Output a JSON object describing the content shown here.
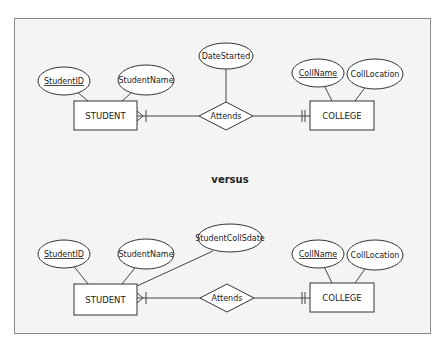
{
  "separator_label": "versus",
  "colors": {
    "frame_bg": "#f4f4f4",
    "frame_border": "#8a8a8a",
    "stroke": "#333333",
    "fill": "#ffffff"
  },
  "diagrams": [
    {
      "name": "diagram-1",
      "entities": [
        {
          "id": "student",
          "label": "STUDENT",
          "x": 74,
          "y": 101,
          "w": 63,
          "h": 29
        },
        {
          "id": "college",
          "label": "COLLEGE",
          "x": 310,
          "y": 101,
          "w": 64,
          "h": 29
        }
      ],
      "relationship": {
        "label": "Attends",
        "cx": 226,
        "cy": 116,
        "hw": 27,
        "hh": 14
      },
      "attributes": [
        {
          "label": "StudentID",
          "key": true,
          "cx": 64,
          "cy": 81,
          "rx": 26,
          "ry": 14,
          "to": [
            88,
            101
          ]
        },
        {
          "label": "StudentName",
          "key": false,
          "cx": 146,
          "cy": 80,
          "rx": 28,
          "ry": 15,
          "to": [
            122,
            101
          ]
        },
        {
          "label": "DateStarted",
          "key": false,
          "cx": 226,
          "cy": 56,
          "rx": 27,
          "ry": 13,
          "to": [
            226,
            102
          ]
        },
        {
          "label": "CollName",
          "key": true,
          "cx": 318,
          "cy": 73,
          "rx": 26,
          "ry": 14,
          "to": [
            332,
            101
          ]
        },
        {
          "label": "CollLocation",
          "key": false,
          "cx": 375,
          "cy": 74,
          "rx": 28,
          "ry": 15,
          "to": [
            355,
            101
          ]
        }
      ],
      "cardinality": {
        "left": "one-or-many",
        "right": "one-and-only-one"
      }
    },
    {
      "name": "diagram-2",
      "entities": [
        {
          "id": "student",
          "label": "STUDENT",
          "x": 74,
          "y": 284,
          "w": 63,
          "h": 31
        },
        {
          "id": "college",
          "label": "COLLEGE",
          "x": 310,
          "y": 283,
          "w": 64,
          "h": 29
        }
      ],
      "relationship": {
        "label": "Attends",
        "cx": 227,
        "cy": 298,
        "hw": 27,
        "hh": 14
      },
      "attributes": [
        {
          "label": "StudentID",
          "key": true,
          "cx": 64,
          "cy": 254,
          "rx": 26,
          "ry": 14,
          "to": [
            88,
            284
          ]
        },
        {
          "label": "StudentName",
          "key": false,
          "cx": 146,
          "cy": 254,
          "rx": 28,
          "ry": 15,
          "to": [
            122,
            284
          ]
        },
        {
          "label": "StudentCollSdate",
          "key": false,
          "cx": 230,
          "cy": 238,
          "rx": 32,
          "ry": 14,
          "to": [
            137,
            286
          ],
          "from": [
            213,
            251
          ]
        },
        {
          "label": "CollName",
          "key": true,
          "cx": 318,
          "cy": 254,
          "rx": 26,
          "ry": 14,
          "to": [
            332,
            283
          ]
        },
        {
          "label": "CollLocation",
          "key": false,
          "cx": 375,
          "cy": 255,
          "rx": 28,
          "ry": 15,
          "to": [
            355,
            283
          ]
        }
      ],
      "cardinality": {
        "left": "one-or-many",
        "right": "one-and-only-one"
      }
    }
  ]
}
